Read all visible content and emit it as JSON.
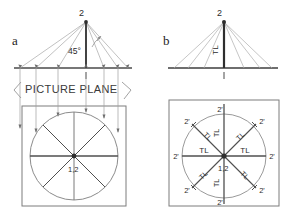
{
  "figure": {
    "panels": [
      {
        "id": "a",
        "letter": "a",
        "elevation": {
          "apex_label": "2",
          "angle_label": "45°",
          "base_label": "1",
          "picture_plane_label": "PICTURE PLANE"
        },
        "plan": {
          "center_label": "1,2"
        }
      },
      {
        "id": "b",
        "letter": "b",
        "elevation": {
          "apex_label": "2",
          "vertical_label": "TL",
          "base_label": "1"
        },
        "plan": {
          "center_label": "1,2",
          "radius_labels": [
            "TL",
            "TL",
            "TL",
            "TL",
            "TL",
            "TL",
            "TL",
            "TL"
          ],
          "endpoint_labels": [
            "2'",
            "2'",
            "2'",
            "2'",
            "2'",
            "2'",
            "2'",
            "2'"
          ]
        }
      }
    ],
    "colors": {
      "ink": "#2b2b2b",
      "line": "#555555",
      "light_line": "#9a9a9a",
      "heavy_line": "#333333",
      "box": "#777777"
    }
  }
}
